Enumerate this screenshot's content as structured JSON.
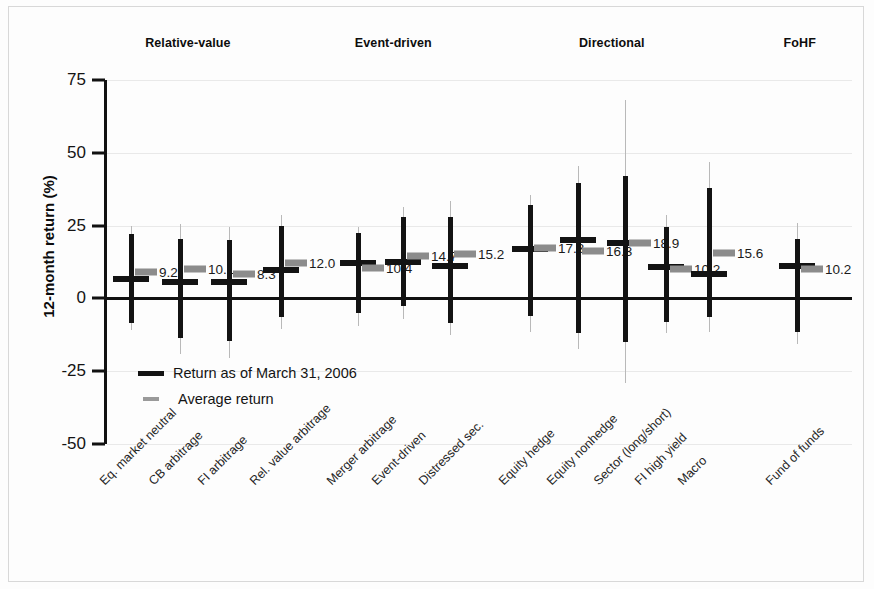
{
  "chart_data": {
    "type": "bar",
    "title": "",
    "xlabel": "",
    "ylabel": "12-month return (%)",
    "ylim": [
      -50,
      75
    ],
    "yticks": [
      75,
      50,
      25,
      0,
      -25,
      -50
    ],
    "grid": true,
    "legend_position": "inside-lower-left",
    "legend": [
      {
        "key": "return",
        "label": "Return as of March 31, 2006",
        "style": "thick-black-line"
      },
      {
        "key": "average",
        "label": "Average return",
        "style": "gray-dash"
      }
    ],
    "group_headers": [
      {
        "label": "Relative-value",
        "x_center_pct": 21.5
      },
      {
        "label": "Event-driven",
        "x_center_pct": 45.0
      },
      {
        "label": "Directional",
        "x_center_pct": 70.0
      },
      {
        "label": "FoHF",
        "x_center_pct": 91.5
      }
    ],
    "categories": [
      "Eq. market neutral",
      "CB arbitrage",
      "FI arbitrage",
      "Rel. value arbitrage",
      "Merger arbitrage",
      "Event-driven",
      "Distressed sec.",
      "Equity hedge",
      "Equity nonhedge",
      "Sector (long/short)",
      "FI high yield",
      "Macro",
      "Fund of funds"
    ],
    "series": [
      {
        "name": "Return as of March 31, 2006",
        "description": "thick black vertical range with horizontal cross marker at the return value",
        "values": [
          6.8,
          5.5,
          5.8,
          9.6,
          12.3,
          12.6,
          11.0,
          17.0,
          20.0,
          19.1,
          10.8,
          8.5,
          11.2
        ],
        "range_high": [
          22.0,
          20.5,
          20.0,
          25.0,
          22.5,
          28.0,
          28.0,
          32.0,
          39.5,
          42.0,
          24.5,
          38.0,
          20.5
        ],
        "range_low": [
          -8.5,
          -13.5,
          -14.5,
          -6.5,
          -5.0,
          -2.5,
          -8.5,
          -6.0,
          -12.0,
          -15.0,
          -8.0,
          -6.5,
          -11.5
        ]
      },
      {
        "name": "Average return",
        "description": "gray horizontal marker at the average value; thin gray vertical line shows full historical range",
        "values": [
          9.2,
          10.1,
          8.3,
          12.0,
          10.4,
          14.7,
          15.2,
          17.3,
          16.3,
          18.9,
          10.2,
          15.6,
          10.2
        ],
        "range_high": [
          25.0,
          25.5,
          24.5,
          28.5,
          24.5,
          31.5,
          33.5,
          35.5,
          45.5,
          68.0,
          28.5,
          47.0,
          26.0
        ],
        "range_low": [
          -11.0,
          -19.0,
          -20.5,
          -10.5,
          -9.5,
          -7.0,
          -12.5,
          -11.5,
          -17.5,
          -29.0,
          -12.0,
          -11.5,
          -15.5
        ]
      }
    ],
    "value_labels": [
      "9.2",
      "10.1",
      "8.3",
      "12.0",
      "10.4",
      "14.7",
      "15.2",
      "17.3",
      "16.3",
      "18.9",
      "10.2",
      "15.6",
      "10.2"
    ],
    "group_membership": [
      "Relative-value",
      "Relative-value",
      "Relative-value",
      "Relative-value",
      "Event-driven",
      "Event-driven",
      "Event-driven",
      "Directional",
      "Directional",
      "Directional",
      "Directional",
      "Directional",
      "FoHF"
    ],
    "x_positions_px": [
      131,
      180,
      229,
      281,
      358,
      403,
      450,
      530,
      578,
      625,
      666,
      709,
      797
    ],
    "colors": {
      "return_line": "#131313",
      "average_marker": "#8c8c8c",
      "average_range_line": "#b9b9b9",
      "gridline": "#e9e9e9",
      "axis": "#111111",
      "background": "#fdfdfd"
    }
  }
}
